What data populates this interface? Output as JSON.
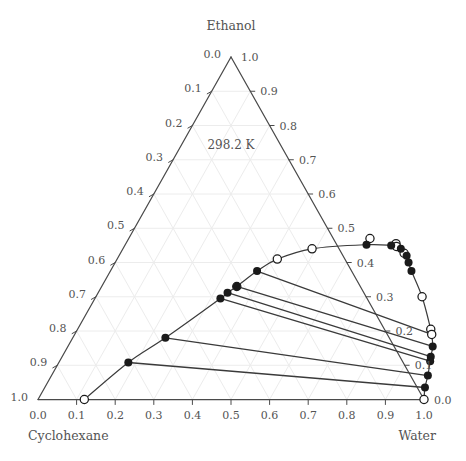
{
  "chart_data": {
    "type": "scatter",
    "plot_kind": "ternary-phase-diagram",
    "title": "",
    "annotation": "298.2 K",
    "corners": {
      "top": "Ethanol",
      "left": "Cyclohexane",
      "right": "Water"
    },
    "axes": {
      "bottom": {
        "name": "Water",
        "direction": "left-to-right",
        "ticks": [
          "0.0",
          "0.1",
          "0.2",
          "0.3",
          "0.4",
          "0.5",
          "0.6",
          "0.7",
          "0.8",
          "0.9",
          "1.0"
        ]
      },
      "left": {
        "name": "Cyclohexane",
        "direction": "top-to-bottom",
        "ticks": [
          "0.0",
          "0.1",
          "0.2",
          "0.3",
          "0.4",
          "0.5",
          "0.6",
          "0.7",
          "0.8",
          "0.9",
          "1.0"
        ]
      },
      "right": {
        "name": "Ethanol",
        "direction": "bottom-to-top",
        "ticks": [
          "0.0",
          "0.1",
          "0.2",
          "0.3",
          "0.4",
          "0.5",
          "0.6",
          "0.7",
          "0.8",
          "0.9",
          "1.0"
        ]
      },
      "range": [
        0.0,
        1.0
      ],
      "step": 0.1,
      "grid": true,
      "legend": "none"
    },
    "binodal_curve": {
      "label": "binodal curve",
      "comment": "points as [water, ethanol] mole fractions; cyclohexane = 1 - water - ethanol",
      "points": [
        [
          0.12,
          0.0
        ],
        [
          0.18,
          0.108
        ],
        [
          0.24,
          0.18
        ],
        [
          0.325,
          0.295
        ],
        [
          0.335,
          0.312
        ],
        [
          0.35,
          0.33
        ],
        [
          0.38,
          0.375
        ],
        [
          0.415,
          0.41
        ],
        [
          0.49,
          0.44
        ],
        [
          0.625,
          0.452
        ],
        [
          0.69,
          0.45
        ],
        [
          0.705,
          0.447
        ],
        [
          0.72,
          0.44
        ],
        [
          0.745,
          0.42
        ],
        [
          0.76,
          0.4
        ],
        [
          0.78,
          0.375
        ],
        [
          0.845,
          0.3
        ],
        [
          0.915,
          0.205
        ],
        [
          0.925,
          0.19
        ],
        [
          0.945,
          0.155
        ],
        [
          0.955,
          0.125
        ],
        [
          0.96,
          0.112
        ],
        [
          0.975,
          0.07
        ],
        [
          0.985,
          0.035
        ],
        [
          1.0,
          0.0
        ]
      ],
      "filled_markers": [
        [
          0.18,
          0.108
        ],
        [
          0.24,
          0.18
        ],
        [
          0.325,
          0.295
        ],
        [
          0.335,
          0.312
        ],
        [
          0.35,
          0.33
        ],
        [
          0.38,
          0.375
        ],
        [
          0.625,
          0.452
        ],
        [
          0.69,
          0.45
        ],
        [
          0.72,
          0.44
        ],
        [
          0.745,
          0.42
        ],
        [
          0.76,
          0.4
        ],
        [
          0.78,
          0.375
        ],
        [
          0.945,
          0.155
        ],
        [
          0.955,
          0.125
        ],
        [
          0.96,
          0.112
        ],
        [
          0.975,
          0.07
        ],
        [
          0.985,
          0.035
        ]
      ],
      "open_markers": [
        [
          0.12,
          0.0
        ],
        [
          0.35,
          0.33
        ],
        [
          0.415,
          0.41
        ],
        [
          0.49,
          0.44
        ],
        [
          0.625,
          0.47
        ],
        [
          0.7,
          0.455
        ],
        [
          0.705,
          0.447
        ],
        [
          0.735,
          0.427
        ],
        [
          0.845,
          0.3
        ],
        [
          0.915,
          0.205
        ],
        [
          0.925,
          0.19
        ],
        [
          1.0,
          0.0
        ]
      ]
    },
    "tie_lines": {
      "label": "tie lines",
      "comment": "each entry is [[water_left, ethanol_left],[water_right, ethanol_right]]",
      "lines": [
        [
          [
            0.18,
            0.108
          ],
          [
            0.985,
            0.035
          ]
        ],
        [
          [
            0.24,
            0.18
          ],
          [
            0.975,
            0.07
          ]
        ],
        [
          [
            0.325,
            0.295
          ],
          [
            0.96,
            0.112
          ]
        ],
        [
          [
            0.335,
            0.312
          ],
          [
            0.955,
            0.125
          ]
        ],
        [
          [
            0.35,
            0.33
          ],
          [
            0.945,
            0.155
          ]
        ],
        [
          [
            0.38,
            0.375
          ],
          [
            0.925,
            0.19
          ]
        ]
      ]
    },
    "colors": {
      "axis": "#4a4a4a",
      "grid": "#ececec",
      "curve": "#3a3a3a",
      "marker_fill": "#1a1a1a",
      "marker_open": "#ffffff",
      "text": "#545454"
    }
  }
}
